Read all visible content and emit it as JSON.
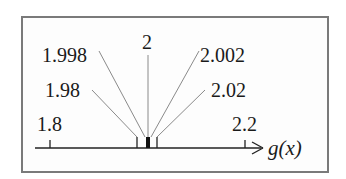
{
  "diagram": {
    "axis_label": "g(x)",
    "axis_label_parts": [
      "g",
      "(",
      "x",
      ")"
    ],
    "colors": {
      "frame": "#7a7a7a",
      "axis": "#222222",
      "leader": "#8a8a8a",
      "text": "#1a1a1a"
    },
    "axis_ticks": [
      {
        "value": "1.8",
        "label": "1.8"
      },
      {
        "value": "2.2",
        "label": "2.2"
      }
    ],
    "callouts": [
      {
        "value": "1.998",
        "label": "1.998"
      },
      {
        "value": "1.98",
        "label": "1.98"
      },
      {
        "value": "2",
        "label": "2"
      },
      {
        "value": "2.002",
        "label": "2.002"
      },
      {
        "value": "2.02",
        "label": "2.02"
      }
    ]
  }
}
